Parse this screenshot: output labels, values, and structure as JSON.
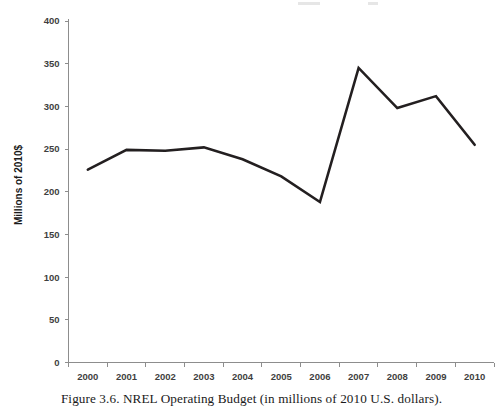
{
  "figure": {
    "caption": "Figure 3.6. NREL Operating Budget (in millions of 2010 U.S. dollars)."
  },
  "chart_data": {
    "type": "line",
    "title": "",
    "xlabel": "",
    "ylabel": "Millions of 2010$",
    "categories": [
      "2000",
      "2001",
      "2002",
      "2003",
      "2004",
      "2005",
      "2006",
      "2007",
      "2008",
      "2009",
      "2010"
    ],
    "values": [
      226,
      249,
      248,
      252,
      238,
      218,
      188,
      345,
      298,
      312,
      255
    ],
    "series": [
      {
        "name": "NREL Operating Budget",
        "values": [
          226,
          249,
          248,
          252,
          238,
          218,
          188,
          345,
          298,
          312,
          255
        ]
      }
    ],
    "ylim": [
      0,
      400
    ],
    "yticks": [
      0,
      50,
      100,
      150,
      200,
      250,
      300,
      350,
      400
    ],
    "ytick_labels": [
      "0",
      "50",
      "100",
      "150",
      "200",
      "250",
      "300",
      "350",
      "400"
    ],
    "xtick_labels": [
      "2000",
      "2001",
      "2002",
      "2003",
      "2004",
      "2005",
      "2006",
      "2007",
      "2008",
      "2009",
      "2010"
    ],
    "grid": false,
    "legend": false,
    "legend_position": "none",
    "line_color": "#231f20",
    "axis_color": "#8d8d8d",
    "units": "millions of 2010 U.S. dollars"
  }
}
